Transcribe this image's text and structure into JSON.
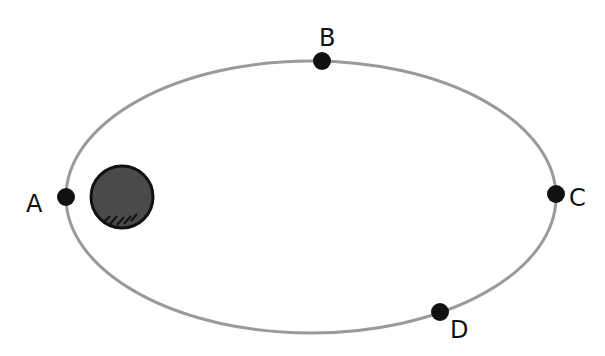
{
  "diagram": {
    "type": "orbit",
    "orbit": {
      "cx": 311,
      "cy": 197,
      "rx": 245,
      "ry": 136,
      "color": "#9a9a9a"
    },
    "central_body": {
      "cx": 122,
      "cy": 197,
      "r": 31,
      "fill": "#4a4a4a"
    },
    "points": [
      {
        "label": "A",
        "x": 66,
        "y": 197,
        "lx": 28,
        "ly": 212
      },
      {
        "label": "B",
        "x": 322,
        "y": 61,
        "lx": 320,
        "ly": 46
      },
      {
        "label": "C",
        "x": 556,
        "y": 194,
        "lx": 568,
        "ly": 207
      },
      {
        "label": "D",
        "x": 440,
        "y": 312,
        "lx": 450,
        "ly": 337
      }
    ]
  }
}
